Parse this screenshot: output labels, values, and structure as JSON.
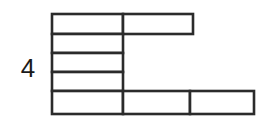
{
  "figure": {
    "label": "4",
    "label_position": "left",
    "line_color": "#2b2b2b",
    "fill_color": "#ffffff",
    "background_color": "#ffffff",
    "stroke_width": 2.6
  },
  "chart_data": {
    "type": "table",
    "title": "",
    "subtitle": "",
    "xlabel": "",
    "ylabel": "",
    "row_label": "4",
    "grid": true,
    "legend": "none",
    "unit_width_px": 71,
    "unit_height_px": 19,
    "columns": 3,
    "rows": 5,
    "x_edges": [
      52,
      123,
      193,
      254
    ],
    "y_edges": [
      14,
      34,
      53,
      72,
      91,
      114
    ],
    "row_cell_counts": [
      2,
      1,
      1,
      1,
      3
    ],
    "cells": [
      {
        "id": "r1c1",
        "row": 1,
        "col": 1,
        "x": 52,
        "y": 14,
        "w": 71,
        "h": 20,
        "label": ""
      },
      {
        "id": "r1c2",
        "row": 1,
        "col": 2,
        "x": 123,
        "y": 14,
        "w": 70,
        "h": 20,
        "label": ""
      },
      {
        "id": "r2c1",
        "row": 2,
        "col": 1,
        "x": 52,
        "y": 34,
        "w": 71,
        "h": 19,
        "label": ""
      },
      {
        "id": "r3c1",
        "row": 3,
        "col": 1,
        "x": 52,
        "y": 53,
        "w": 71,
        "h": 19,
        "label": ""
      },
      {
        "id": "r4c1",
        "row": 4,
        "col": 1,
        "x": 52,
        "y": 72,
        "w": 71,
        "h": 19,
        "label": ""
      },
      {
        "id": "r5c1",
        "row": 5,
        "col": 1,
        "x": 52,
        "y": 91,
        "w": 71,
        "h": 23,
        "label": ""
      },
      {
        "id": "r5c2",
        "row": 5,
        "col": 2,
        "x": 123,
        "y": 91,
        "w": 67,
        "h": 23,
        "label": ""
      },
      {
        "id": "r5c3",
        "row": 5,
        "col": 3,
        "x": 190,
        "y": 91,
        "w": 64,
        "h": 23,
        "label": ""
      }
    ]
  }
}
